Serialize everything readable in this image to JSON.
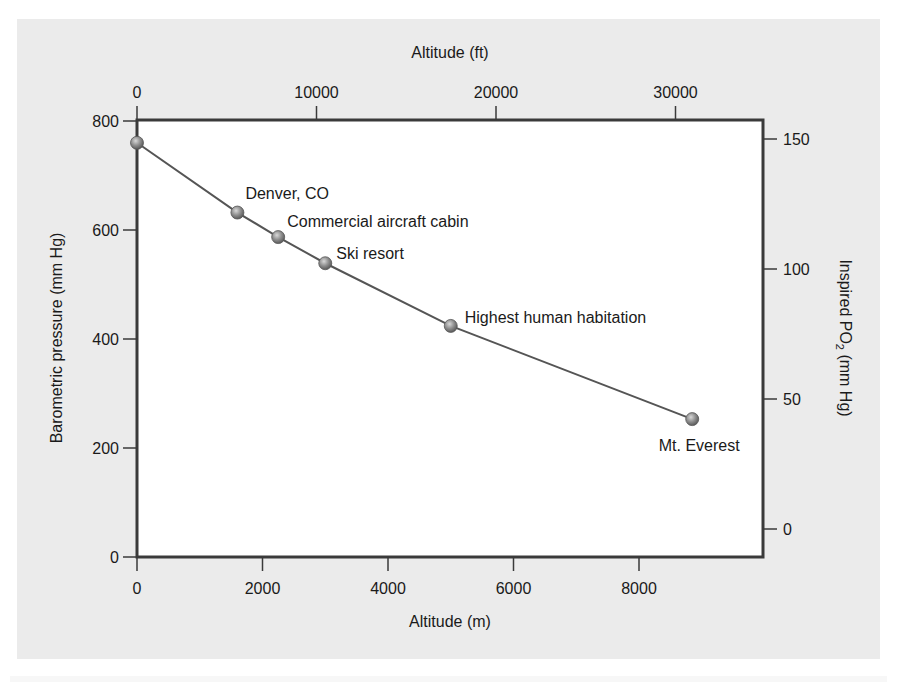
{
  "chart_data": {
    "type": "line",
    "title": "",
    "xlabel": "Altitude (m)",
    "ylabel": "Barometric pressure (mm Hg)",
    "x2label": "Altitude (ft)",
    "y2label": "Inspired PO2 (mm Hg)",
    "xlim": [
      0,
      10000
    ],
    "ylim": [
      0,
      800
    ],
    "y2lim": [
      -12,
      160
    ],
    "x_ticks": [
      0,
      2000,
      4000,
      6000,
      8000
    ],
    "y_ticks": [
      0,
      200,
      400,
      600,
      800
    ],
    "x2_ticks": [
      0,
      10000,
      20000,
      30000
    ],
    "y2_ticks": [
      0,
      50,
      100,
      150
    ],
    "grid": false,
    "legend": null,
    "series": [
      {
        "name": "Barometric pressure",
        "x": [
          0,
          1600,
          2250,
          3000,
          5000,
          8848
        ],
        "values": [
          760,
          632,
          587,
          539,
          424,
          253
        ],
        "labels": [
          "",
          "Denver, CO",
          "Commercial aircraft cabin",
          "Ski resort",
          "Highest human habitation",
          "Mt. Everest"
        ]
      }
    ],
    "annotations": [
      "Denver, CO",
      "Commercial aircraft cabin",
      "Ski resort",
      "Highest human habitation",
      "Mt. Everest"
    ]
  },
  "colors": {
    "panel_bg": "#ebebeb",
    "plot_bg": "#ffffff",
    "axis": "#3a3a3a",
    "line": "#555555",
    "marker": "#8a8a8a"
  }
}
